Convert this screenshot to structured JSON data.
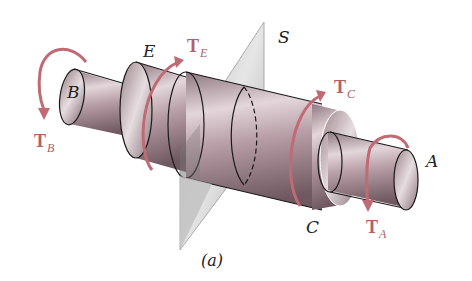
{
  "figure": {
    "caption": "(a)",
    "plane_label": "S",
    "point_labels": {
      "B": "B",
      "E": "E",
      "C": "C",
      "A": "A"
    },
    "torques": [
      {
        "id": "TB",
        "main": "T",
        "sub": "B"
      },
      {
        "id": "TE",
        "main": "T",
        "sub": "E"
      },
      {
        "id": "TC",
        "main": "T",
        "sub": "C"
      },
      {
        "id": "TA",
        "main": "T",
        "sub": "A"
      }
    ],
    "colors": {
      "shaft": "#b59aa2",
      "shaft_dark": "#7e646c",
      "shaft_light": "#e2d4d8",
      "plane": "#c8c8c8",
      "torque_arrow": "#c06a74",
      "outline": "#1a1a1a"
    }
  }
}
